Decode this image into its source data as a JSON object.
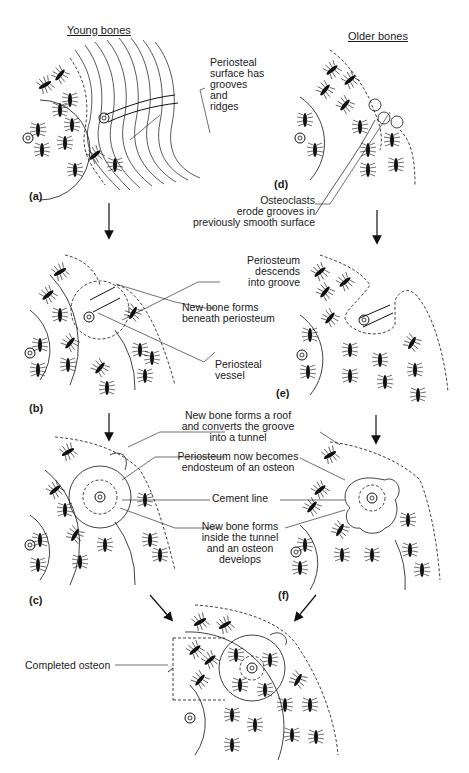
{
  "titles": {
    "young": "Young bones",
    "older": "Older bones"
  },
  "panels": {
    "a": "(a)",
    "b": "(b)",
    "c": "(c)",
    "d": "(d)",
    "e": "(e)",
    "f": "(f)"
  },
  "labels": {
    "periosteal_surface": [
      "Periosteal",
      "surface has",
      "grooves",
      "and",
      "ridges"
    ],
    "osteoclasts": [
      "Osteoclasts",
      "erode grooves in",
      "previously smooth surface"
    ],
    "periosteum_descends": [
      "Periosteum",
      "descends",
      "into groove"
    ],
    "new_bone_beneath": [
      "New bone forms",
      "beneath periosteum"
    ],
    "periosteal_vessel": [
      "Periosteal",
      "vessel"
    ],
    "new_bone_roof": [
      "New bone forms a roof",
      "and converts the groove",
      "into a tunnel"
    ],
    "periosteum_endosteum": [
      "Periosteum now becomes",
      "endosteum of an osteon"
    ],
    "cement_line": "Cement line",
    "new_bone_inside": [
      "New bone forms",
      "inside the tunnel",
      "and an osteon",
      "develops"
    ],
    "completed_osteon": "Completed osteon"
  }
}
